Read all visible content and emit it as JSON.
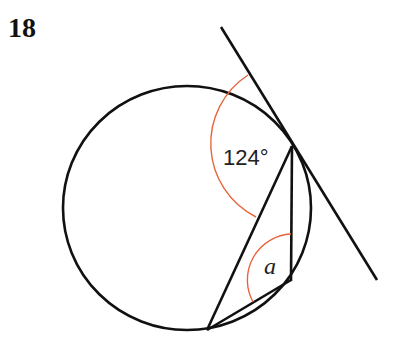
{
  "question_number": "18",
  "labels": {
    "angle_given": "124°",
    "angle_unknown": "a"
  },
  "colors": {
    "line": "#111111",
    "angle_arc": "#e8643c"
  },
  "geometry": {
    "circle": {
      "cx": 187,
      "cy": 208,
      "r": 123
    },
    "tangent_point": [
      292,
      146
    ],
    "tangent_line": [
      [
        221,
        27
      ],
      [
        377,
        280
      ]
    ],
    "chords": [
      [
        [
          292,
          146
        ],
        [
          207,
          330
        ]
      ],
      [
        [
          292,
          146
        ],
        [
          291,
          280
        ]
      ],
      [
        [
          291,
          280
        ],
        [
          207,
          330
        ]
      ]
    ]
  }
}
